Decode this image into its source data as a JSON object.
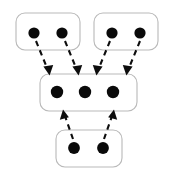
{
  "figure": {
    "type": "node-group-graph",
    "width": 172,
    "height": 176,
    "background_color": "#ffffff",
    "node_color": "#0a0a0a",
    "group_border_color": "#b9b9b9",
    "group_fill_color": "#ffffff",
    "edge_color": "#0d0d0d",
    "edge_style": "dashed",
    "edge_arrowhead": "solid-triangle"
  },
  "groups": [
    {
      "id": "group-top-left",
      "label": "",
      "x": 16,
      "y": 13,
      "width": 64,
      "height": 37,
      "radius": 9,
      "node_count": 2,
      "nodes": [
        {
          "id": "tl-n1",
          "cx": 34,
          "cy": 33,
          "r": 5.6
        },
        {
          "id": "tl-n2",
          "cx": 62,
          "cy": 33,
          "r": 5.6
        }
      ]
    },
    {
      "id": "group-top-right",
      "label": "",
      "x": 94,
      "y": 13,
      "width": 64,
      "height": 37,
      "radius": 9,
      "node_count": 2,
      "nodes": [
        {
          "id": "tr-n1",
          "cx": 112,
          "cy": 33,
          "r": 5.6
        },
        {
          "id": "tr-n2",
          "cx": 140,
          "cy": 33,
          "r": 5.6
        }
      ]
    },
    {
      "id": "group-middle",
      "label": "",
      "x": 40,
      "y": 74,
      "width": 97,
      "height": 37,
      "radius": 9,
      "node_count": 3,
      "nodes": [
        {
          "id": "mid-n1",
          "cx": 57,
          "cy": 92,
          "r": 6.2
        },
        {
          "id": "mid-n2",
          "cx": 85,
          "cy": 92,
          "r": 6.2
        },
        {
          "id": "mid-n3",
          "cx": 113,
          "cy": 92,
          "r": 6.2
        }
      ]
    },
    {
      "id": "group-bottom",
      "label": "",
      "x": 56,
      "y": 130,
      "width": 66,
      "height": 37,
      "radius": 9,
      "node_count": 2,
      "nodes": [
        {
          "id": "bot-n1",
          "cx": 74,
          "cy": 148,
          "r": 5.9
        },
        {
          "id": "bot-n2",
          "cx": 103,
          "cy": 148,
          "r": 5.9
        }
      ]
    }
  ],
  "edges": [
    {
      "id": "edge-tl1-mid",
      "from": "tl-n1",
      "to": "group-middle",
      "x1": 36,
      "y1": 41,
      "x2": 49,
      "y2": 73,
      "direction": "down-right"
    },
    {
      "id": "edge-tl2-mid",
      "from": "tl-n2",
      "to": "group-middle",
      "x1": 65,
      "y1": 41,
      "x2": 78,
      "y2": 73,
      "direction": "down-right"
    },
    {
      "id": "edge-tr1-mid",
      "from": "tr-n1",
      "to": "group-middle",
      "x1": 110,
      "y1": 41,
      "x2": 97,
      "y2": 73,
      "direction": "down-left"
    },
    {
      "id": "edge-tr2-mid",
      "from": "tr-n2",
      "to": "group-middle",
      "x1": 140,
      "y1": 41,
      "x2": 127,
      "y2": 73,
      "direction": "down-left"
    },
    {
      "id": "edge-bot1-mid",
      "from": "bot-n1",
      "to": "group-middle",
      "x1": 73,
      "y1": 139,
      "x2": 63,
      "y2": 112,
      "direction": "up-left"
    },
    {
      "id": "edge-bot2-mid",
      "from": "bot-n2",
      "to": "group-middle",
      "x1": 104,
      "y1": 139,
      "x2": 114,
      "y2": 112,
      "direction": "up-right"
    }
  ]
}
